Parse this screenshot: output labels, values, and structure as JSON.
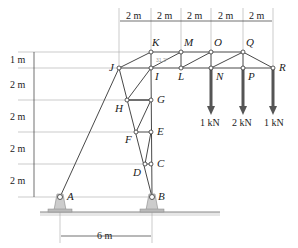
{
  "diagram": {
    "type": "truss",
    "colors": {
      "member": "#333333",
      "guide": "#999999",
      "support": "#c8c8c8",
      "load_arrow": "#555555",
      "ground": "#888888"
    },
    "nodes": [
      {
        "id": "A",
        "label": "A"
      },
      {
        "id": "B",
        "label": "B"
      },
      {
        "id": "C",
        "label": "C"
      },
      {
        "id": "D",
        "label": "D"
      },
      {
        "id": "E",
        "label": "E"
      },
      {
        "id": "F",
        "label": "F"
      },
      {
        "id": "G",
        "label": "G"
      },
      {
        "id": "H",
        "label": "H"
      },
      {
        "id": "I",
        "label": "I"
      },
      {
        "id": "J",
        "label": "J"
      },
      {
        "id": "K",
        "label": "K"
      },
      {
        "id": "L",
        "label": "L"
      },
      {
        "id": "M",
        "label": "M"
      },
      {
        "id": "N",
        "label": "N"
      },
      {
        "id": "O",
        "label": "O"
      },
      {
        "id": "P",
        "label": "P"
      },
      {
        "id": "Q",
        "label": "Q"
      },
      {
        "id": "R",
        "label": "R"
      }
    ],
    "top_dimensions": [
      "2 m",
      "2 m",
      "2 m",
      "2 m",
      "2 m"
    ],
    "left_dimensions": [
      "1 m",
      "2 m",
      "2 m",
      "2 m",
      "2 m"
    ],
    "bottom_dimension": "6 m",
    "loads": [
      {
        "node": "N",
        "label": "1 kN"
      },
      {
        "node": "P",
        "label": "2 kN"
      },
      {
        "node": "R",
        "label": "1 kN"
      }
    ],
    "angle_note": "31.2°"
  }
}
